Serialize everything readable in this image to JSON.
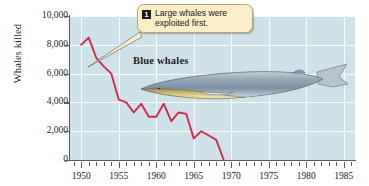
{
  "chart_data": {
    "type": "line",
    "title": "",
    "xlabel": "",
    "ylabel": "Whales killed",
    "xlim": [
      1948.5,
      1986.5
    ],
    "ylim": [
      0,
      10000
    ],
    "grid": true,
    "legend": "none",
    "series_name": "Blue whales",
    "line_color": "#d02b4c",
    "plot_background": "#cfe2e9",
    "gridline_color": "#ffffff",
    "x": [
      1950,
      1951,
      1952,
      1953,
      1954,
      1955,
      1956,
      1957,
      1958,
      1959,
      1960,
      1961,
      1962,
      1963,
      1964,
      1965,
      1966,
      1967,
      1968,
      1969
    ],
    "values": [
      8000,
      8500,
      7100,
      6500,
      6000,
      4200,
      4000,
      3300,
      3900,
      3000,
      3000,
      3900,
      2700,
      3300,
      3200,
      1500,
      2000,
      1700,
      1400,
      0
    ],
    "ytick_labels": [
      "10,000",
      "8,000",
      "6,000",
      "4,000",
      "2,000",
      "0"
    ],
    "ytick_values": [
      10000,
      8000,
      6000,
      4000,
      2000,
      0
    ],
    "xtick_labels": [
      "1950",
      "1955",
      "1960",
      "1965",
      "1970",
      "1975",
      "1980",
      "1985"
    ],
    "xtick_values": [
      1950,
      1955,
      1960,
      1965,
      1970,
      1975,
      1980,
      1985
    ],
    "minor_xtick_step": 1,
    "annotations": [
      {
        "badge": "1",
        "text": "Large whales were\nexploited first.",
        "points_to_year": 1952,
        "points_to_value": 6600
      },
      {
        "text": "Blue whales",
        "kind": "series-label"
      }
    ]
  }
}
